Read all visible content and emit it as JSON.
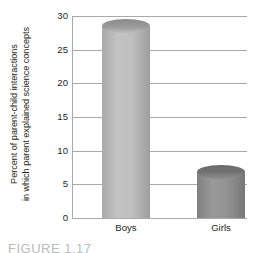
{
  "chart_data": {
    "type": "bar",
    "title": "",
    "categories": [
      "Boys",
      "Girls"
    ],
    "values": [
      28.5,
      6.8
    ],
    "xlabel": "",
    "ylabel_line1": "Percent of parent-child interactions",
    "ylabel_line2": "in which parent explained science concepts",
    "ylim": [
      0,
      30
    ],
    "yticks": [
      30,
      25,
      20,
      15,
      10,
      5,
      0
    ],
    "ytick_labels": [
      "30",
      "25",
      "20",
      "15",
      "10",
      "5",
      "0"
    ],
    "grid": true,
    "legend": "none",
    "bar_colors": [
      "#bcbcbc",
      "#8e8e8e"
    ],
    "grid_color": "#a7a9ac",
    "text_color": "#231f20"
  },
  "caption": {
    "text": "FIGURE 1.17"
  }
}
